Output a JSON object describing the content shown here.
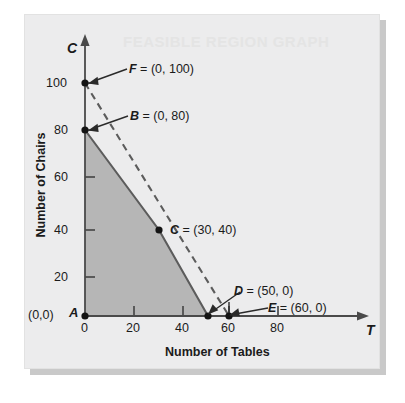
{
  "figure": {
    "watermark_text": "FEASIBLE REGION GRAPH",
    "background_color": "#ececed",
    "shade_color": "#b6b6b6",
    "line_color": "#5c5c5c",
    "axis_color": "#4a4a4a"
  },
  "chart_data": {
    "type": "line",
    "title": "",
    "xlabel": "Number of Tables",
    "ylabel": "Number of Chairs",
    "x_axis_symbol": "T",
    "y_axis_symbol": "C",
    "origin_label": "(0,0)",
    "xlim": [
      0,
      95
    ],
    "ylim": [
      0,
      118
    ],
    "xticks": [
      0,
      20,
      40,
      60,
      80
    ],
    "xtick_labels": [
      "0",
      "20",
      "40",
      "60",
      "80"
    ],
    "yticks": [
      20,
      40,
      60,
      80,
      100
    ],
    "ytick_labels": [
      "20",
      "40",
      "60",
      "80",
      "100"
    ],
    "grid": false,
    "legend": "none",
    "points": [
      {
        "id": "A",
        "label": "A",
        "annotation": "",
        "x": 0,
        "y": 0,
        "marker": true
      },
      {
        "id": "B",
        "label": "B",
        "annotation": "B = (0, 80)",
        "x": 0,
        "y": 80,
        "marker": true
      },
      {
        "id": "C",
        "label": "C",
        "annotation": "C = (30, 40)",
        "x": 30,
        "y": 40,
        "marker": true
      },
      {
        "id": "D",
        "label": "D",
        "annotation": "D = (50, 0)",
        "x": 50,
        "y": 0,
        "marker": true
      },
      {
        "id": "E",
        "label": "E",
        "annotation": "E = (60, 0)",
        "x": 60,
        "y": 0,
        "marker": true
      },
      {
        "id": "F",
        "label": "F",
        "annotation": "F = (0, 100)",
        "x": 0,
        "y": 100,
        "marker": true
      }
    ],
    "series": [
      {
        "name": "constraint-boundary-solid",
        "style": "solid",
        "points": [
          [
            0,
            80
          ],
          [
            30,
            40
          ],
          [
            50,
            0
          ]
        ]
      },
      {
        "name": "constraint-boundary-dashed",
        "style": "dashed",
        "points": [
          [
            0,
            100
          ],
          [
            60,
            0
          ]
        ]
      }
    ],
    "shaded_region": {
      "name": "feasible-region",
      "vertices": [
        [
          0,
          0
        ],
        [
          0,
          80
        ],
        [
          30,
          40
        ],
        [
          50,
          0
        ]
      ]
    },
    "annotations": [
      {
        "text": "F = (0, 100)",
        "target": "F"
      },
      {
        "text": "B = (0, 80)",
        "target": "B"
      },
      {
        "text": "C = (30, 40)",
        "target": "C"
      },
      {
        "text": "D = (50, 0)",
        "target": "D"
      },
      {
        "text": "E = (60, 0)",
        "target": "E"
      }
    ]
  }
}
